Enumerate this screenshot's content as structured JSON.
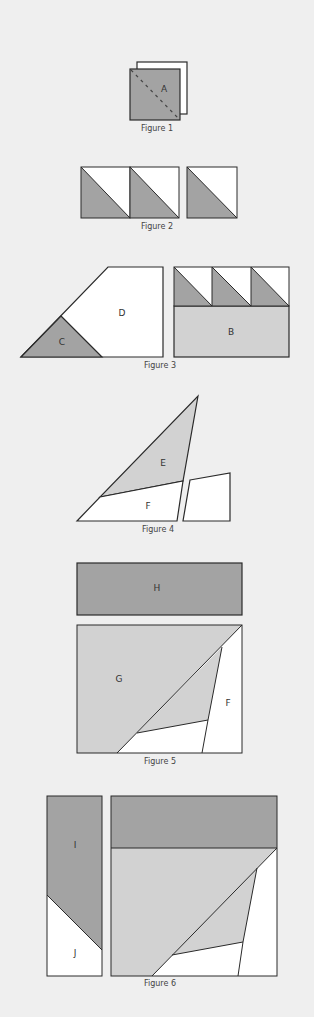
{
  "figures": [
    {
      "id": 1,
      "caption": "Figure 1",
      "labels": {
        "A": "A"
      }
    },
    {
      "id": 2,
      "caption": "Figure 2",
      "labels": {}
    },
    {
      "id": 3,
      "caption": "Figure 3",
      "labels": {
        "B": "B",
        "C": "C",
        "D": "D"
      }
    },
    {
      "id": 4,
      "caption": "Figure 4",
      "labels": {
        "E": "E",
        "F": "F"
      }
    },
    {
      "id": 5,
      "caption": "Figure 5",
      "labels": {
        "H": "H",
        "G": "G",
        "F": "F"
      }
    },
    {
      "id": 6,
      "caption": "Figure 6",
      "labels": {
        "I": "I",
        "J": "J"
      }
    }
  ],
  "colors": {
    "background": "#efefef",
    "dark_fabric": "#a3a3a3",
    "light_fabric": "#d2d2d2",
    "white_fabric": "#ffffff",
    "outline": "#2a2a2a"
  }
}
